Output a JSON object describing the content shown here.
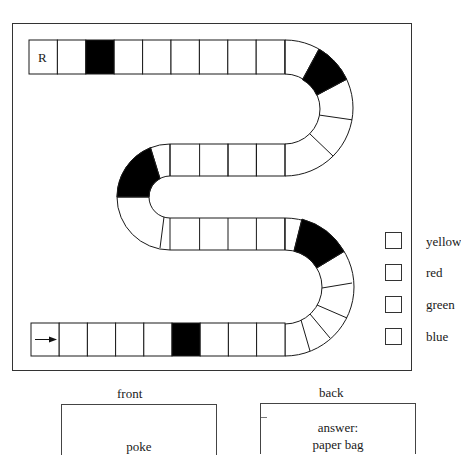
{
  "top_text_fragment": "g g p   p",
  "board": {
    "start_square_label": "R",
    "end_square_icon": "arrow-right-icon",
    "colors": {
      "line": "#1a1a1a",
      "fill": "#ffffff",
      "special_fill": "#000000"
    },
    "special_squares": [
      "top-row-3",
      "right-top-curve-2",
      "left-curve-2",
      "right-bottom-curve-1",
      "bottom-row-6"
    ]
  },
  "legend": {
    "items": [
      {
        "label": "yellow"
      },
      {
        "label": "red"
      },
      {
        "label": "green"
      },
      {
        "label": "blue"
      }
    ]
  },
  "cards": {
    "front": {
      "title": "front",
      "text": "poke"
    },
    "back": {
      "title": "back",
      "line1": "answer:",
      "line2": "paper bag"
    }
  }
}
